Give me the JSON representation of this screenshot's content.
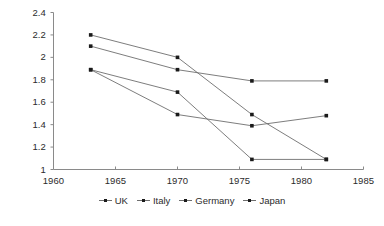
{
  "chart_data": {
    "type": "line",
    "title": "",
    "subtitle": "",
    "xlabel": "",
    "ylabel": "",
    "xlim": [
      1960,
      1985
    ],
    "ylim": [
      1,
      2.4
    ],
    "grid": false,
    "legend_position": "bottom",
    "xticks": [
      "1960",
      "1965",
      "1970",
      "1975",
      "1980",
      "1985"
    ],
    "xtick_values": [
      1960,
      1965,
      1970,
      1975,
      1980,
      1985
    ],
    "yticks": [
      "1",
      "1.2",
      "1.4",
      "1.6",
      "1.8",
      "2",
      "2.2",
      "2.4"
    ],
    "ytick_values": [
      1,
      1.2,
      1.4,
      1.6,
      1.8,
      2,
      2.2,
      2.4
    ],
    "x": [
      1963,
      1970,
      1976,
      1982
    ],
    "series": [
      {
        "name": "UK",
        "values": [
          2.1,
          1.89,
          1.79,
          1.79
        ]
      },
      {
        "name": "Italy",
        "values": [
          2.2,
          2.0,
          1.49,
          1.09
        ]
      },
      {
        "name": "Germany",
        "values": [
          1.89,
          1.69,
          1.09,
          1.09
        ]
      },
      {
        "name": "Japan",
        "values": [
          1.89,
          1.49,
          1.39,
          1.48
        ]
      }
    ],
    "line_color": "#6e6e6e",
    "marker_color": "#1a1a1a",
    "axis_color": "#8a8a8a",
    "background": "#ffffff"
  },
  "legend": {
    "items": [
      {
        "label": "UK"
      },
      {
        "label": "Italy"
      },
      {
        "label": "Germany"
      },
      {
        "label": "Japan"
      }
    ]
  }
}
